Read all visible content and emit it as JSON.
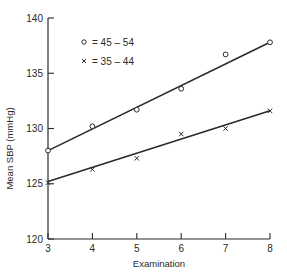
{
  "chart_data": {
    "type": "scatter",
    "title": "",
    "xlabel": "Examination",
    "ylabel": "Mean SBP (mmHg)",
    "xlim": [
      3,
      8
    ],
    "ylim": [
      120,
      140
    ],
    "x_ticks": [
      "3",
      "4",
      "5",
      "6",
      "7",
      "8"
    ],
    "y_ticks": [
      "120",
      "125",
      "130",
      "135",
      "140"
    ],
    "grid": false,
    "legend_position": "upper-left inside",
    "x": [
      3,
      4,
      5,
      6,
      7,
      8
    ],
    "series": [
      {
        "name": "45 – 54",
        "marker": "circle",
        "values": [
          128.0,
          130.2,
          131.7,
          133.6,
          136.7,
          137.8
        ],
        "fit_line": [
          [
            3,
            128.0
          ],
          [
            8,
            137.8
          ]
        ]
      },
      {
        "name": "35 – 44",
        "marker": "cross",
        "values": [
          125.1,
          126.3,
          127.3,
          129.5,
          130.0,
          131.6
        ],
        "fit_line": [
          [
            3,
            125.2
          ],
          [
            8,
            131.6
          ]
        ]
      }
    ]
  },
  "legend": {
    "items": [
      {
        "symbol": "○",
        "label": "= 45 – 54"
      },
      {
        "symbol": "×",
        "label": "= 35 – 44"
      }
    ]
  }
}
